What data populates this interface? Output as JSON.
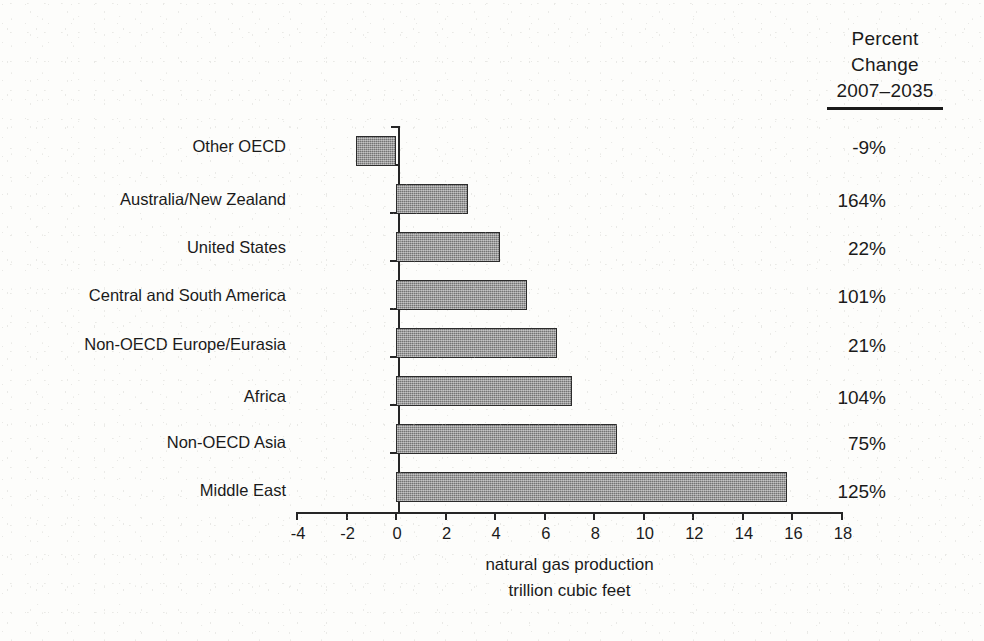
{
  "chart_data": {
    "type": "bar",
    "orientation": "horizontal",
    "title": "",
    "xlabel_lines": [
      "natural gas production",
      "trillion cubic feet"
    ],
    "ylabel": "",
    "xlim": [
      -4,
      18
    ],
    "xticks": [
      -4,
      -2,
      0,
      2,
      4,
      6,
      8,
      10,
      12,
      14,
      16,
      18
    ],
    "xtick_labels": [
      "-4",
      "-2",
      "0",
      "2",
      "4",
      "6",
      "8",
      "10",
      "12",
      "14",
      "16",
      "18"
    ],
    "grid": false,
    "legend": "none",
    "categories": [
      "Other OECD",
      "Australia/New Zealand",
      "United States",
      "Central and South America",
      "Non-OECD Europe/Eurasia",
      "Africa",
      "Non-OECD Asia",
      "Middle East"
    ],
    "values": [
      -1.6,
      2.9,
      4.2,
      5.3,
      6.5,
      7.1,
      8.9,
      15.8
    ],
    "annotations": {
      "column_header_lines": [
        "Percent",
        "Change",
        "2007–2035"
      ],
      "column_values": [
        "-9%",
        "164%",
        "22%",
        "101%",
        "21%",
        "104%",
        "75%",
        "125%"
      ]
    }
  },
  "percent_column": {
    "header": {
      "line1": "Percent",
      "line2": "Change",
      "line3": "2007–2035"
    },
    "values": [
      "-9%",
      "164%",
      "22%",
      "101%",
      "21%",
      "104%",
      "75%",
      "125%"
    ]
  },
  "axis": {
    "caption_line1": "natural gas production",
    "caption_line2": "trillion cubic feet"
  },
  "colors": {
    "bar_fill": "#8e8e8e",
    "bar_border": "#2b2b2b",
    "axis": "#262626",
    "text": "#1a1a1a",
    "background": "#fdfdfb"
  }
}
